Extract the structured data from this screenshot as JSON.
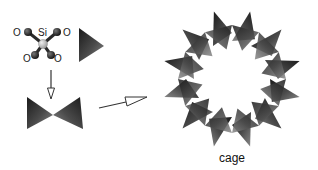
{
  "diagram": {
    "molecule": {
      "center_label": "Si",
      "oxygen_label": "O",
      "oxygen_count": 4
    },
    "tetrahedron_symbol": "tetrahedron",
    "dimer_symbol": "corner-sharing-tetrahedra-pair",
    "cage": {
      "label": "cage",
      "tetrahedra_count": 12
    },
    "colors": {
      "tetra_dark": "#1e1e1e",
      "tetra_mid": "#5a5a5a",
      "tetra_light": "#8c8c8c",
      "arrow": "#333333",
      "si_atom": "#bdbdbd",
      "o_bond": "#2a2a2a"
    }
  }
}
